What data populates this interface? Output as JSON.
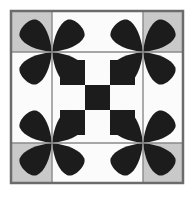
{
  "artwork": {
    "title": "Quilt Block Pattern",
    "type": "geometric-quilt-block",
    "canvas": {
      "width": 194,
      "height": 198,
      "background": "#ffffff"
    }
  },
  "palette": {
    "background": "#ffffff",
    "frame": "#6b6b6b",
    "gridline": "#8a8a8a",
    "gray_fill": "#c9c9c9",
    "white_fill": "#fbfbfb",
    "black_fill": "#1c1c1c"
  },
  "frame": {
    "label": "outer-frame",
    "x": 11,
    "y": 11,
    "width": 172,
    "height": 172,
    "stroke_width": 2.5,
    "stroke": "#6b6b6b"
  },
  "outer_grid": {
    "label": "three-by-three-grid",
    "columns": 3,
    "rows": 3,
    "x_stops": [
      12,
      52,
      143,
      182
    ],
    "y_stops": [
      12,
      52,
      143,
      182
    ],
    "gridline_color": "#8a8a8a",
    "gridline_width": 1.4,
    "cells": [
      {
        "row": 0,
        "col": 0,
        "fill": "gray_fill",
        "name": "cell-top-left"
      },
      {
        "row": 0,
        "col": 1,
        "fill": "white_fill",
        "name": "cell-top-center"
      },
      {
        "row": 0,
        "col": 2,
        "fill": "gray_fill",
        "name": "cell-top-right"
      },
      {
        "row": 1,
        "col": 0,
        "fill": "white_fill",
        "name": "cell-middle-left"
      },
      {
        "row": 1,
        "col": 1,
        "fill": "white_fill",
        "name": "cell-center"
      },
      {
        "row": 1,
        "col": 2,
        "fill": "white_fill",
        "name": "cell-middle-right"
      },
      {
        "row": 2,
        "col": 0,
        "fill": "gray_fill",
        "name": "cell-bottom-left"
      },
      {
        "row": 2,
        "col": 1,
        "fill": "white_fill",
        "name": "cell-bottom-center"
      },
      {
        "row": 2,
        "col": 2,
        "fill": "gray_fill",
        "name": "cell-bottom-right"
      }
    ]
  },
  "checkerboard": {
    "label": "center-checkerboard",
    "columns": 3,
    "rows": 3,
    "x": 60,
    "y": 60,
    "cell_size": 25,
    "pattern": [
      [
        "black",
        "white",
        "black"
      ],
      [
        "white",
        "black",
        "white"
      ],
      [
        "black",
        "white",
        "black"
      ]
    ]
  },
  "flowers": {
    "label": "four-petal-flower-motifs",
    "count": 4,
    "petals_per_flower": 4,
    "petal_fill": "#1c1c1c",
    "petal_length": 39,
    "petal_width": 30,
    "centers": [
      {
        "name": "flower-top-left",
        "cx": 52,
        "cy": 52
      },
      {
        "name": "flower-top-right",
        "cx": 143,
        "cy": 52
      },
      {
        "name": "flower-bottom-left",
        "cx": 52,
        "cy": 143
      },
      {
        "name": "flower-bottom-right",
        "cx": 143,
        "cy": 143
      }
    ],
    "petal_angles": [
      225,
      315,
      135,
      45
    ]
  }
}
